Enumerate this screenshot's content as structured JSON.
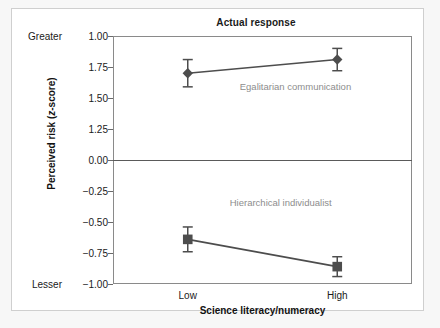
{
  "figure": {
    "background_color": "#f7f7f7",
    "card_background": "#ffffff",
    "border_color": "#cfcfcf"
  },
  "chart_data": {
    "type": "line",
    "title": "Actual response",
    "xlabel": "Science literacy/numeracy",
    "ylabel": "Perceived risk (z-score)",
    "categories": [
      "Low",
      "High"
    ],
    "x": [
      0,
      1
    ],
    "ytick_labels": [
      "1.00",
      "1.75",
      "1.50",
      "1.25",
      "0.00",
      "-0.25",
      "-0.50",
      "-0.75",
      "-1.00"
    ],
    "ytick_positions": [
      1.0,
      0.75,
      0.5,
      0.25,
      0.0,
      -0.25,
      -0.5,
      -0.75,
      -1.0
    ],
    "ylim": [
      -1.0,
      1.0
    ],
    "grid": false,
    "zero_line": true,
    "legend_position": "inline-annotation",
    "axis_extreme_labels": {
      "top": "Greater",
      "bottom": "Lesser"
    },
    "series": [
      {
        "name": "Egalitarian communication",
        "marker": "diamond",
        "color": "#4d4d4d",
        "values": [
          0.7,
          0.81
        ],
        "errors": [
          0.11,
          0.09
        ],
        "annotation": "Egalitarian communication"
      },
      {
        "name": "Hierarchical individualist",
        "marker": "square",
        "color": "#4d4d4d",
        "values": [
          -0.64,
          -0.86
        ],
        "errors": [
          0.1,
          0.08
        ],
        "annotation": "Hierarchical individualist"
      }
    ]
  },
  "labels": {
    "greater": "Greater",
    "lesser": "Lesser",
    "xtick_low": "Low",
    "xtick_high": "High"
  }
}
